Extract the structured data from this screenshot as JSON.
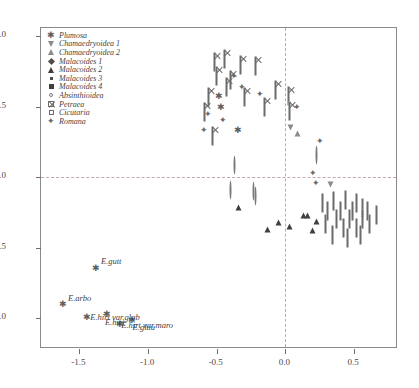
{
  "chart_data": {
    "type": "scatter",
    "title": "",
    "xlabel": "",
    "ylabel": "",
    "xlim": [
      -1.78,
      0.82
    ],
    "ylim": [
      -1.22,
      1.06
    ],
    "grid": false,
    "zero_lines": {
      "x": 0.0,
      "y": 0.0,
      "style": "dashed"
    },
    "xticks": [
      "-1.5",
      "-1.0",
      "-0.5",
      "0.0",
      "0.5"
    ],
    "xtick_values": [
      -1.5,
      -1.0,
      -0.5,
      0.0,
      0.5
    ],
    "yticks": [
      "1.0",
      "0.5",
      "0.0",
      "-0.5",
      "-1.0"
    ],
    "ytick_values": [
      1.0,
      0.5,
      0.0,
      -0.5,
      -1.0
    ],
    "legend_position": "top-left",
    "series": [
      {
        "name": "Plumosa",
        "marker": "star",
        "points": [
          [
            -0.49,
            0.6
          ],
          [
            -0.47,
            0.52
          ],
          [
            -0.35,
            0.36
          ],
          [
            -1.38,
            -0.62
          ],
          [
            -1.62,
            -0.88
          ],
          [
            -1.45,
            -0.97
          ],
          [
            -1.3,
            -0.95
          ],
          [
            -1.21,
            -1.02
          ],
          [
            -1.12,
            -0.99
          ]
        ]
      },
      {
        "name": "Chamaedryoidea 1",
        "marker": "triangle-down-open",
        "points": [
          [
            0.04,
            0.27
          ],
          [
            0.33,
            -0.13
          ]
        ]
      },
      {
        "name": "Chamaedryoidea 2",
        "marker": "triangle-up-open",
        "points": [
          [
            0.09,
            0.27
          ]
        ]
      },
      {
        "name": "Malacoides 1",
        "marker": "diamond-filled",
        "points": [
          [
            -0.23,
            0.13
          ],
          [
            -0.33,
            -0.06
          ],
          [
            -0.24,
            -0.06
          ],
          [
            -0.16,
            -0.07
          ],
          [
            -0.28,
            -0.13
          ],
          [
            -0.22,
            -0.25
          ],
          [
            0.02,
            -0.06
          ],
          [
            0.1,
            -0.29
          ],
          [
            0.22,
            -0.31
          ],
          [
            0.28,
            -0.38
          ],
          [
            0.31,
            -0.36
          ],
          [
            0.36,
            -0.2
          ],
          [
            0.4,
            -0.18
          ],
          [
            0.44,
            -0.15
          ],
          [
            0.47,
            -0.12
          ],
          [
            0.18,
            -0.43
          ],
          [
            0.24,
            -0.45
          ],
          [
            0.3,
            -0.47
          ],
          [
            0.34,
            -0.43
          ],
          [
            0.42,
            -0.3
          ],
          [
            0.5,
            -0.25
          ],
          [
            0.41,
            -0.4
          ],
          [
            0.27,
            -0.52
          ],
          [
            0.12,
            -0.44
          ],
          [
            0.0,
            -0.41
          ],
          [
            -0.06,
            -0.36
          ],
          [
            0.52,
            -0.18
          ],
          [
            0.56,
            -0.22
          ],
          [
            0.21,
            0.02
          ]
        ]
      },
      {
        "name": "Malacoides 2",
        "marker": "triangle-filled",
        "points": [
          [
            -0.34,
            -0.13
          ],
          [
            -0.05,
            -0.24
          ],
          [
            0.03,
            -0.27
          ],
          [
            0.13,
            -0.19
          ],
          [
            0.16,
            -0.19
          ],
          [
            -0.13,
            -0.29
          ],
          [
            0.2,
            -0.3
          ],
          [
            0.23,
            -0.23
          ]
        ]
      },
      {
        "name": "Malacoides 3",
        "marker": "square-small",
        "points": [
          [
            -0.29,
            0.43
          ],
          [
            -0.25,
            0.44
          ],
          [
            -0.27,
            0.39
          ]
        ]
      },
      {
        "name": "Malacoides 4",
        "marker": "square-filled",
        "points": [
          [
            -0.28,
            0.45
          ],
          [
            -0.23,
            0.46
          ],
          [
            -0.26,
            0.4
          ],
          [
            -0.43,
            0.26
          ],
          [
            -0.25,
            0.37
          ]
        ]
      },
      {
        "name": "Absinthioidea",
        "marker": "circle-open",
        "points": [
          [
            -0.37,
            0.09
          ],
          [
            -0.4,
            -0.09
          ],
          [
            -0.23,
            -0.1
          ],
          [
            -0.22,
            -0.13
          ],
          [
            0.23,
            0.16
          ]
        ]
      },
      {
        "name": "Petraea",
        "marker": "square-crossed",
        "points": [
          [
            -0.52,
            0.82
          ],
          [
            -0.44,
            0.84
          ],
          [
            -0.33,
            0.8
          ],
          [
            -0.5,
            0.72
          ],
          [
            -0.4,
            0.69
          ],
          [
            -0.43,
            0.64
          ],
          [
            -0.22,
            0.79
          ],
          [
            -0.3,
            0.57
          ],
          [
            -0.07,
            0.62
          ],
          [
            -0.15,
            0.5
          ],
          [
            0.02,
            0.58
          ],
          [
            0.03,
            0.47
          ],
          [
            -0.56,
            0.57
          ],
          [
            -0.59,
            0.46
          ],
          [
            -0.53,
            0.29
          ]
        ]
      },
      {
        "name": "Cicutaria",
        "marker": "square-open",
        "points": [
          [
            0.27,
            -0.18
          ],
          [
            0.35,
            -0.17
          ],
          [
            0.44,
            -0.16
          ],
          [
            0.52,
            -0.18
          ],
          [
            0.31,
            -0.24
          ],
          [
            0.4,
            -0.24
          ],
          [
            0.49,
            -0.24
          ],
          [
            0.56,
            -0.22
          ],
          [
            0.6,
            -0.24
          ],
          [
            0.37,
            -0.3
          ],
          [
            0.47,
            -0.3
          ],
          [
            0.56,
            -0.3
          ],
          [
            0.42,
            -0.36
          ],
          [
            0.52,
            -0.36
          ],
          [
            0.61,
            -0.33
          ],
          [
            0.34,
            -0.41
          ],
          [
            0.45,
            -0.43
          ],
          [
            0.55,
            -0.41
          ],
          [
            0.29,
            -0.33
          ],
          [
            0.66,
            -0.27
          ]
        ]
      },
      {
        "name": "Romana",
        "marker": "diamond-cross",
        "points": [
          [
            -0.38,
            0.74
          ],
          [
            -0.32,
            0.66
          ],
          [
            -0.19,
            0.61
          ],
          [
            -0.57,
            0.47
          ],
          [
            -0.6,
            0.36
          ],
          [
            0.08,
            0.52
          ],
          [
            0.25,
            0.28
          ],
          [
            0.2,
            0.05
          ],
          [
            0.22,
            -0.02
          ],
          [
            -0.46,
            0.43
          ]
        ]
      }
    ],
    "annotations": [
      {
        "label": "E.gutt",
        "x": -1.38,
        "y": -0.62
      },
      {
        "label": "E.arbo",
        "x": -1.62,
        "y": -0.88
      },
      {
        "label": "E.hirt var.glab",
        "x": -1.45,
        "y": -0.97
      },
      {
        "label": "E.hirt var.maro",
        "x": -1.21,
        "y": -1.02
      },
      {
        "label": "E.hirt",
        "x": -1.3,
        "y": -0.95
      },
      {
        "label": "E.glau",
        "x": -1.12,
        "y": -0.99
      }
    ]
  },
  "legend": {
    "items": [
      {
        "label": "Plumosa",
        "marker": "star"
      },
      {
        "label": "Chamaedryoidea 1",
        "marker": "triangle-down-open"
      },
      {
        "label": "Chamaedryoidea 2",
        "marker": "triangle-up-open"
      },
      {
        "label": "Malacoides 1",
        "marker": "diamond-filled"
      },
      {
        "label": "Malacoides 2",
        "marker": "triangle-filled"
      },
      {
        "label": "Malacoides 3",
        "marker": "square-small"
      },
      {
        "label": "Malacoides 4",
        "marker": "square-filled"
      },
      {
        "label": "Absinthioidea",
        "marker": "circle-open"
      },
      {
        "label": "Petraea",
        "marker": "square-crossed"
      },
      {
        "label": "Cicutaria",
        "marker": "square-open"
      },
      {
        "label": "Romana",
        "marker": "diamond-cross"
      }
    ]
  },
  "colors": {
    "point": "#4d4d4d",
    "frame": "#8a8a8a",
    "zero_line": "#c9a6a6",
    "text": "#3f3f3f"
  }
}
